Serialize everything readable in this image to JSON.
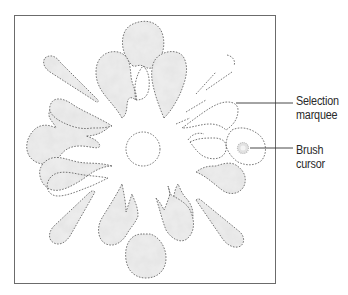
{
  "figure": {
    "frame": {
      "x": 14,
      "y": 15,
      "width": 261,
      "height": 268,
      "stroke": "#6b6b6b"
    },
    "marquee_stroke": "#555555",
    "fill_colors": {
      "light": "#e6e6e6",
      "mid": "#cfcfcf",
      "dark": "#b8b8b8"
    }
  },
  "callouts": [
    {
      "id": "selection-marquee",
      "lines": [
        "Selection",
        "marquee"
      ],
      "line_from": [
        236,
        103
      ],
      "line_to": [
        293,
        103
      ],
      "label_x": 296,
      "label_y": 94
    },
    {
      "id": "brush-cursor",
      "lines": [
        "Brush",
        "cursor"
      ],
      "line_from": [
        252,
        148
      ],
      "line_to": [
        293,
        148
      ],
      "label_x": 296,
      "label_y": 143
    }
  ],
  "elements": {
    "center_circle": {
      "cx": 143,
      "cy": 149,
      "r": 17
    },
    "brush_cursor": {
      "cx": 243,
      "cy": 148,
      "r": 5
    }
  }
}
